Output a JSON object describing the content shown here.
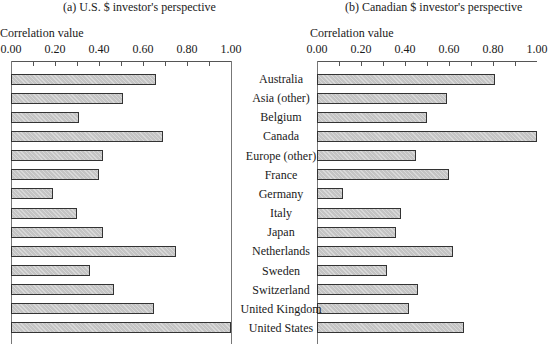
{
  "chart_data": [
    {
      "type": "bar",
      "orientation": "horizontal",
      "title": "(a) U.S. $ investor's perspective",
      "xlabel": "Correlation value",
      "ylabel": "",
      "xlim": [
        0,
        1.0
      ],
      "xticks": [
        "0.00",
        "0.20",
        "0.40",
        "0.60",
        "0.80",
        "1.00"
      ],
      "grid": false,
      "categories": [
        "Australia",
        "Asia (other)",
        "Belgium",
        "Canada",
        "Europe (other)",
        "France",
        "Germany",
        "Italy",
        "Japan",
        "Netherlands",
        "Sweden",
        "Switzerland",
        "United Kingdom",
        "United States"
      ],
      "values": [
        0.66,
        0.51,
        0.31,
        0.69,
        0.42,
        0.4,
        0.19,
        0.3,
        0.42,
        0.75,
        0.36,
        0.47,
        0.65,
        1.0
      ]
    },
    {
      "type": "bar",
      "orientation": "horizontal",
      "title": "(b) Canadian $ investor's perspective",
      "xlabel": "Correlation value",
      "ylabel": "",
      "xlim": [
        0,
        1.0
      ],
      "xticks": [
        "0.00",
        "0.20",
        "0.40",
        "0.60",
        "0.80",
        "1.00"
      ],
      "grid": false,
      "categories": [
        "Australia",
        "Asia (other)",
        "Belgium",
        "Canada",
        "Europe (other)",
        "France",
        "Germany",
        "Italy",
        "Japan",
        "Netherlands",
        "Sweden",
        "Switzerland",
        "United Kingdom",
        "United States"
      ],
      "values": [
        0.81,
        0.59,
        0.5,
        1.0,
        0.45,
        0.6,
        0.12,
        0.38,
        0.36,
        0.62,
        0.32,
        0.46,
        0.42,
        0.67
      ]
    }
  ],
  "colors": {
    "bar_fill": "#c4c4c4",
    "bar_border": "#333333",
    "axis": "#555555"
  }
}
